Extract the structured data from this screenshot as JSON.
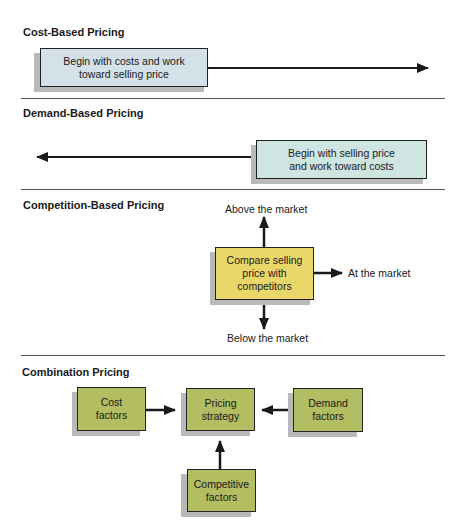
{
  "sections": {
    "cost": {
      "title": "Cost-Based Pricing",
      "box_line1": "Begin with costs and work",
      "box_line2": "toward selling price",
      "arrow_direction": "right"
    },
    "demand": {
      "title": "Demand-Based Pricing",
      "box_line1": "Begin with selling price",
      "box_line2": "and work toward costs",
      "arrow_direction": "left"
    },
    "competition": {
      "title": "Competition-Based Pricing",
      "box_line1": "Compare selling",
      "box_line2": "price with",
      "box_line3": "competitors",
      "above": "Above the market",
      "at": "At the market",
      "below": "Below the market"
    },
    "combination": {
      "title": "Combination Pricing",
      "cost_line1": "Cost",
      "cost_line2": "factors",
      "strategy_line1": "Pricing",
      "strategy_line2": "strategy",
      "demand_line1": "Demand",
      "demand_line2": "factors",
      "competitive_line1": "Competitive",
      "competitive_line2": "factors"
    }
  },
  "colors": {
    "cost_box": "#d4e1e9",
    "demand_box": "#cfe5e2",
    "competition_box": "#ead76a",
    "combination_box": "#b3bd62",
    "arrow": "#1a1a1a",
    "divider": "#555555"
  }
}
